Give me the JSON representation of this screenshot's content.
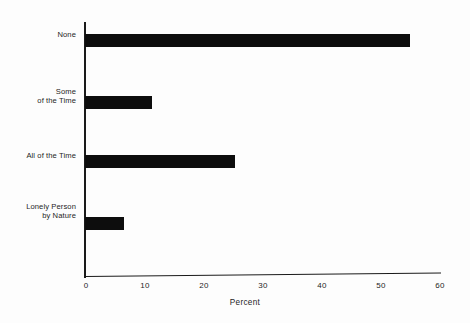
{
  "chart_data": {
    "type": "bar",
    "orientation": "horizontal",
    "title": "",
    "subtitle": "",
    "xlabel": "Percent",
    "ylabel": "",
    "categories": [
      "None",
      "Some\nof the Time",
      "All of the Time",
      "Lonely Person\nby Nature"
    ],
    "values": [
      55.0,
      11.3,
      25.3,
      6.6
    ],
    "xlim": [
      0,
      60
    ],
    "xticks": [
      0,
      10,
      20,
      30,
      40,
      50,
      60
    ],
    "xtick_labels": [
      "0",
      "10",
      "20",
      "30",
      "40",
      "50",
      "60"
    ],
    "grid": false,
    "legend": false,
    "bar_color": "#0d0d0d",
    "axis_color": "#1a1a1a",
    "background_color": "#fdfdfd"
  },
  "axis": {
    "x_title": "Percent"
  },
  "categories": [
    {
      "line1": "None",
      "line2": ""
    },
    {
      "line1": "Some",
      "line2": "of the Time"
    },
    {
      "line1": "All of the Time",
      "line2": ""
    },
    {
      "line1": "Lonely Person",
      "line2": "by Nature"
    }
  ]
}
